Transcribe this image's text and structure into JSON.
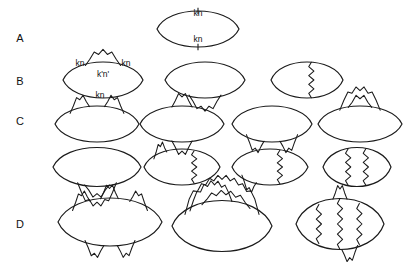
{
  "figure": {
    "background_color": "#ffffff",
    "line_color": "#1a1a1a",
    "width": 410,
    "height": 262
  },
  "row_labels": [
    {
      "id": "A",
      "text": "A",
      "x": 20,
      "y": 39
    },
    {
      "id": "B",
      "text": "B",
      "x": 20,
      "y": 82
    },
    {
      "id": "C",
      "text": "C",
      "x": 20,
      "y": 122
    },
    {
      "id": "D",
      "text": "D",
      "x": 20,
      "y": 225
    }
  ],
  "momentum_labels": [
    {
      "id": "a-top",
      "text": "kn",
      "x": 198,
      "y": 14
    },
    {
      "id": "a-bottom",
      "text": "kn",
      "x": 198,
      "y": 40
    },
    {
      "id": "b-left",
      "text": "kn",
      "x": 80,
      "y": 64
    },
    {
      "id": "b-right",
      "text": "kn",
      "x": 126,
      "y": 64
    },
    {
      "id": "b-mid",
      "text": "k'n'",
      "x": 103,
      "y": 75
    },
    {
      "id": "b-bottom",
      "text": "kn",
      "x": 100,
      "y": 96
    }
  ],
  "diagrams": {
    "A": [
      {
        "id": "A1",
        "name": "bare-bubble",
        "cx": 198,
        "cy": 29,
        "rx": 41,
        "ry": 12,
        "phonons": [],
        "ticks": [
          {
            "edge": "top",
            "t": 0.5
          },
          {
            "edge": "bottom",
            "t": 0.5
          }
        ]
      }
    ],
    "B": [
      {
        "id": "B1",
        "name": "bubble-with-top-phonon-self-energy",
        "cx": 103,
        "cy": 80,
        "rx": 40,
        "ry": 12,
        "phonons": [
          {
            "edge": "top",
            "from": 0.28,
            "to": 0.72,
            "height": 9,
            "cycles": 4
          }
        ],
        "ticks": []
      },
      {
        "id": "B2",
        "name": "bubble-with-bottom-phonon-self-energy",
        "cx": 205,
        "cy": 80,
        "rx": 40,
        "ry": 12,
        "phonons": [
          {
            "edge": "bottom",
            "from": 0.3,
            "to": 0.7,
            "height": 9,
            "cycles": 4
          }
        ],
        "ticks": []
      },
      {
        "id": "B3",
        "name": "bubble-with-vertical-phonon-rung",
        "cx": 307,
        "cy": 80,
        "rx": 36,
        "ry": 12,
        "phonons": [
          {
            "edge": "vertical",
            "t": 0.56,
            "cycles": 4
          }
        ],
        "ticks": []
      }
    ],
    "C": [
      {
        "id": "C1",
        "name": "bubble-two-separate-top-phonons",
        "cx": 97,
        "cy": 124,
        "rx": 42,
        "ry": 12,
        "phonons": [
          {
            "edge": "top",
            "from": 0.18,
            "to": 0.41,
            "height": 8,
            "cycles": 3
          },
          {
            "edge": "top",
            "from": 0.59,
            "to": 0.82,
            "height": 8,
            "cycles": 3
          }
        ],
        "ticks": []
      },
      {
        "id": "C2",
        "name": "bubble-top-and-bottom-phonons",
        "cx": 182,
        "cy": 124,
        "rx": 42,
        "ry": 12,
        "phonons": [
          {
            "edge": "top",
            "from": 0.38,
            "to": 0.62,
            "height": 8,
            "cycles": 3
          },
          {
            "edge": "bottom",
            "from": 0.38,
            "to": 0.62,
            "height": 8,
            "cycles": 3
          }
        ],
        "ticks": []
      },
      {
        "id": "C3",
        "name": "bubble-two-separate-bottom-phonons",
        "cx": 272,
        "cy": 124,
        "rx": 40,
        "ry": 12,
        "phonons": [
          {
            "edge": "bottom",
            "from": 0.18,
            "to": 0.4,
            "height": 8,
            "cycles": 3
          },
          {
            "edge": "bottom",
            "from": 0.6,
            "to": 0.82,
            "height": 8,
            "cycles": 3
          }
        ],
        "ticks": []
      },
      {
        "id": "C4",
        "name": "bubble-nested-top-phonons",
        "cx": 360,
        "cy": 124,
        "rx": 42,
        "ry": 12,
        "phonons": [
          {
            "edge": "top",
            "from": 0.26,
            "to": 0.74,
            "height": 14,
            "cycles": 5
          },
          {
            "edge": "top",
            "from": 0.36,
            "to": 0.64,
            "height": 7,
            "cycles": 3
          }
        ],
        "ticks": []
      },
      {
        "id": "C5",
        "name": "bubble-nested-bottom-phonons",
        "cx": 97,
        "cy": 167,
        "rx": 44,
        "ry": 13,
        "phonons": [
          {
            "edge": "bottom",
            "from": 0.28,
            "to": 0.72,
            "height": 14,
            "cycles": 5
          },
          {
            "edge": "bottom",
            "from": 0.36,
            "to": 0.64,
            "height": 7,
            "cycles": 3
          }
        ],
        "ticks": []
      },
      {
        "id": "C6",
        "name": "bubble-top-phonon-and-vertical-rung",
        "cx": 182,
        "cy": 167,
        "rx": 38,
        "ry": 12,
        "phonons": [
          {
            "edge": "top",
            "from": 0.13,
            "to": 0.3,
            "height": 7,
            "cycles": 3
          },
          {
            "edge": "vertical",
            "t": 0.66,
            "cycles": 4
          }
        ],
        "ticks": []
      },
      {
        "id": "C7",
        "name": "bubble-bottom-phonon-and-vertical-rung",
        "cx": 270,
        "cy": 167,
        "rx": 38,
        "ry": 12,
        "phonons": [
          {
            "edge": "bottom",
            "from": 0.13,
            "to": 0.32,
            "height": 7,
            "cycles": 3
          },
          {
            "edge": "vertical",
            "t": 0.63,
            "cycles": 4
          }
        ],
        "ticks": []
      },
      {
        "id": "C8",
        "name": "bubble-two-vertical-rungs",
        "cx": 357,
        "cy": 167,
        "rx": 34,
        "ry": 13,
        "phonons": [
          {
            "edge": "vertical",
            "t": 0.37,
            "cycles": 4
          },
          {
            "edge": "vertical",
            "t": 0.63,
            "cycles": 4
          }
        ],
        "ticks": []
      }
    ],
    "D": [
      {
        "id": "D1",
        "name": "bubble-three-top-two-bottom-phonons",
        "cx": 110,
        "cy": 222,
        "rx": 52,
        "ry": 16,
        "phonons": [
          {
            "edge": "top",
            "from": 0.14,
            "to": 0.31,
            "height": 8,
            "cycles": 3
          },
          {
            "edge": "top",
            "from": 0.41,
            "to": 0.58,
            "height": 8,
            "cycles": 3
          },
          {
            "edge": "top",
            "from": 0.69,
            "to": 0.86,
            "height": 8,
            "cycles": 3
          },
          {
            "edge": "bottom",
            "from": 0.26,
            "to": 0.44,
            "height": 8,
            "cycles": 3
          },
          {
            "edge": "bottom",
            "from": 0.57,
            "to": 0.74,
            "height": 8,
            "cycles": 3
          }
        ],
        "ticks": []
      },
      {
        "id": "D2",
        "name": "bubble-triple-nested-top-phonons",
        "cx": 222,
        "cy": 226,
        "rx": 50,
        "ry": 17,
        "phonons": [
          {
            "edge": "top",
            "from": 0.13,
            "to": 0.87,
            "height": 24,
            "cycles": 9
          },
          {
            "edge": "top",
            "from": 0.18,
            "to": 0.6,
            "height": 15,
            "cycles": 6
          },
          {
            "edge": "top",
            "from": 0.3,
            "to": 0.78,
            "height": 9,
            "cycles": 5
          }
        ],
        "ticks": []
      },
      {
        "id": "D3",
        "name": "bubble-three-vertical-rungs-and-phonons",
        "cx": 340,
        "cy": 224,
        "rx": 44,
        "ry": 17,
        "phonons": [
          {
            "edge": "vertical",
            "t": 0.26,
            "cycles": 4
          },
          {
            "edge": "vertical",
            "t": 0.5,
            "cycles": 5
          },
          {
            "edge": "vertical",
            "t": 0.72,
            "cycles": 4
          },
          {
            "edge": "top",
            "from": 0.42,
            "to": 0.58,
            "height": 8,
            "cycles": 3
          },
          {
            "edge": "bottom",
            "from": 0.52,
            "to": 0.7,
            "height": 8,
            "cycles": 3
          }
        ],
        "ticks": []
      }
    ]
  }
}
